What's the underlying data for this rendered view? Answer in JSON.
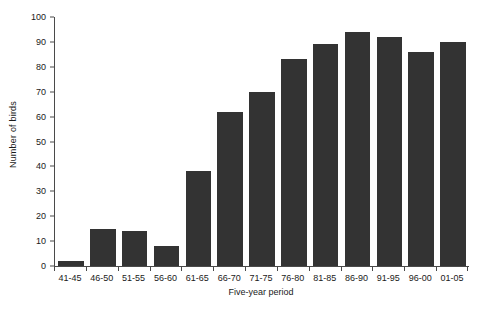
{
  "chart_data": {
    "type": "bar",
    "title": "",
    "xlabel": "Five-year period",
    "ylabel": "Number of birds",
    "categories": [
      "41-45",
      "46-50",
      "51-55",
      "56-60",
      "61-65",
      "66-70",
      "71-75",
      "76-80",
      "81-85",
      "86-90",
      "91-95",
      "96-00",
      "01-05"
    ],
    "values": [
      2,
      15,
      14,
      8,
      38,
      62,
      70,
      83,
      89,
      94,
      92,
      86,
      90
    ],
    "ylim": [
      0,
      100
    ],
    "yticks": [
      0,
      10,
      20,
      30,
      40,
      50,
      60,
      70,
      80,
      90,
      100
    ],
    "ytick_labels": [
      "0",
      "10",
      "20",
      "30",
      "40",
      "50",
      "60",
      "70",
      "80",
      "90",
      "100"
    ],
    "grid": false,
    "legend": null,
    "bar_color": "#333333",
    "axis_color": "#4a4a4a",
    "background_color": "#ffffff"
  }
}
